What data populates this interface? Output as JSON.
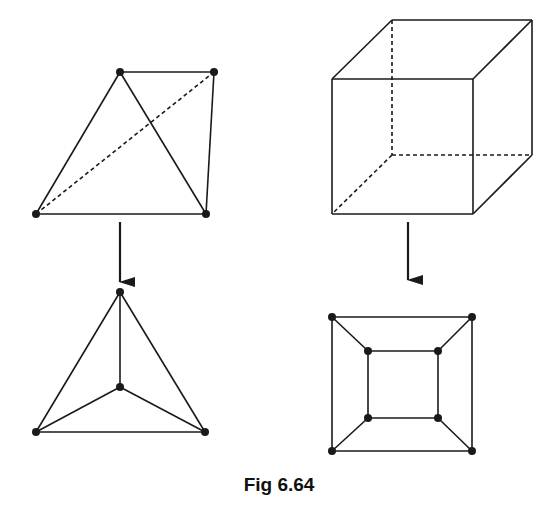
{
  "figure": {
    "caption": "Fig 6.64",
    "stroke_color": "#1a1a1a",
    "panels": [
      {
        "name": "tetrahedron",
        "solid_3d": {
          "vertices": [
            [
              120,
              72
            ],
            [
              214,
              72
            ],
            [
              36,
              214
            ],
            [
              206,
              214
            ]
          ],
          "solid_edges": [
            [
              0,
              1
            ],
            [
              0,
              2
            ],
            [
              0,
              3
            ],
            [
              2,
              3
            ],
            [
              1,
              3
            ]
          ],
          "dashed_edges": [
            [
              2,
              1
            ]
          ]
        },
        "arrow": {
          "x": 120,
          "y1": 222,
          "y2": 282
        },
        "planar_graph": {
          "vertices": [
            [
              120,
              292
            ],
            [
              120,
              387
            ],
            [
              36,
              432
            ],
            [
              205,
              432
            ]
          ],
          "edges": [
            [
              0,
              1
            ],
            [
              0,
              2
            ],
            [
              0,
              3
            ],
            [
              1,
              2
            ],
            [
              1,
              3
            ],
            [
              2,
              3
            ]
          ]
        }
      },
      {
        "name": "cube",
        "solid_3d": {
          "vertices": [
            [
              332,
              79
            ],
            [
              473,
              79
            ],
            [
              473,
              214
            ],
            [
              332,
              214
            ],
            [
              392,
              20
            ],
            [
              532,
              20
            ],
            [
              532,
              155
            ],
            [
              392,
              155
            ]
          ],
          "solid_edges": [
            [
              0,
              1
            ],
            [
              1,
              2
            ],
            [
              2,
              3
            ],
            [
              3,
              0
            ],
            [
              0,
              4
            ],
            [
              4,
              5
            ],
            [
              5,
              1
            ],
            [
              5,
              6
            ],
            [
              6,
              2
            ]
          ],
          "dashed_edges": [
            [
              4,
              7
            ],
            [
              7,
              6
            ],
            [
              7,
              3
            ]
          ]
        },
        "arrow": {
          "x": 408,
          "y1": 222,
          "y2": 280
        },
        "planar_graph": {
          "vertices": [
            [
              332,
              317
            ],
            [
              472,
              317
            ],
            [
              472,
              451
            ],
            [
              332,
              451
            ],
            [
              368,
              351
            ],
            [
              438,
              351
            ],
            [
              438,
              418
            ],
            [
              368,
              418
            ]
          ],
          "edges": [
            [
              0,
              1
            ],
            [
              1,
              2
            ],
            [
              2,
              3
            ],
            [
              3,
              0
            ],
            [
              4,
              5
            ],
            [
              5,
              6
            ],
            [
              6,
              7
            ],
            [
              7,
              4
            ],
            [
              0,
              4
            ],
            [
              1,
              5
            ],
            [
              2,
              6
            ],
            [
              3,
              7
            ]
          ]
        }
      }
    ]
  }
}
